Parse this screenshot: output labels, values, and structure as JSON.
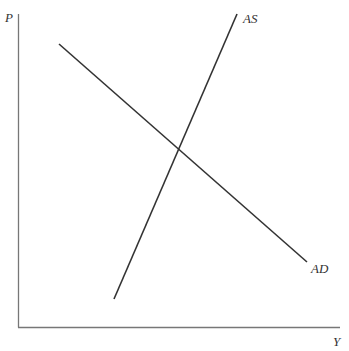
{
  "diagram": {
    "title": "",
    "axes": {
      "y_label": "P",
      "x_label": "Y"
    },
    "curves": [
      {
        "id": "AS",
        "label": "AS",
        "from": [
          114,
          299
        ],
        "to": [
          237,
          14
        ]
      },
      {
        "id": "AD",
        "label": "AD",
        "from": [
          59,
          44
        ],
        "to": [
          307,
          262
        ]
      }
    ],
    "colors": {
      "axis": "#777777",
      "curve": "#333333",
      "text": "#333333",
      "background": "#ffffff"
    }
  }
}
